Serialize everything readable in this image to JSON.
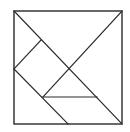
{
  "diagram": {
    "type": "tangram",
    "title": "",
    "stroke_color": "#2a2a2a",
    "background": "#ffffff",
    "frame": {
      "x1": 14,
      "y1": 11,
      "x2": 122,
      "y2": 124
    },
    "lines": [
      {
        "name": "main-diagonal",
        "x1": 14,
        "y1": 11,
        "x2": 122,
        "y2": 124
      },
      {
        "name": "anti-diagonal",
        "x1": 122,
        "y1": 11,
        "x2": 43,
        "y2": 97
      },
      {
        "name": "square-top-left-edge",
        "x1": 41,
        "y1": 40,
        "x2": 14,
        "y2": 69
      },
      {
        "name": "lower-left-diagonal",
        "x1": 14,
        "y1": 69,
        "x2": 68,
        "y2": 124
      },
      {
        "name": "horizontal-edge",
        "x1": 43,
        "y1": 97,
        "x2": 97,
        "y2": 97
      }
    ]
  }
}
